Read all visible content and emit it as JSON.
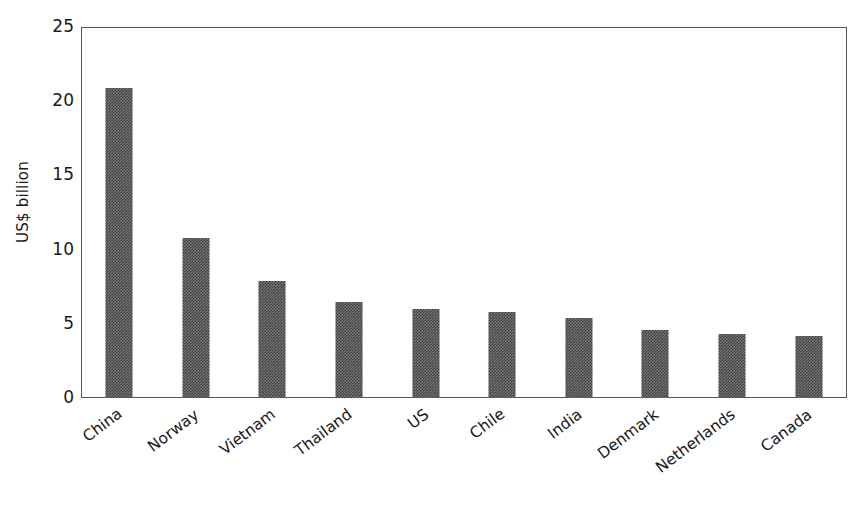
{
  "chart_data": {
    "type": "bar",
    "title": "",
    "subtitle": "",
    "xlabel": "",
    "ylabel": "US$ billion",
    "categories": [
      "China",
      "Norway",
      "Vietnam",
      "Thailand",
      "US",
      "Chile",
      "India",
      "Denmark",
      "Netherlands",
      "Canada"
    ],
    "values": [
      20.9,
      10.8,
      7.9,
      6.5,
      6.0,
      5.8,
      5.4,
      4.6,
      4.3,
      4.2
    ],
    "ylim": [
      0,
      25
    ],
    "ytick_labels": [
      "0",
      "5",
      "10",
      "15",
      "20",
      "25"
    ],
    "ytick_values": [
      0,
      5,
      10,
      15,
      20,
      25
    ],
    "grid": false,
    "legend": null,
    "legend_position": "none",
    "series": [
      {
        "name": "Export value",
        "values": [
          20.9,
          10.8,
          7.9,
          6.5,
          6.0,
          5.8,
          5.4,
          4.6,
          4.3,
          4.2
        ]
      }
    ],
    "annotations": []
  },
  "style": {
    "bar_color": "#787878",
    "bar_pattern": "checkered-dither",
    "axis_color": "#555555",
    "text_color": "#1a1a1a",
    "background": "#ffffff",
    "x_label_rotation_deg": -37
  }
}
